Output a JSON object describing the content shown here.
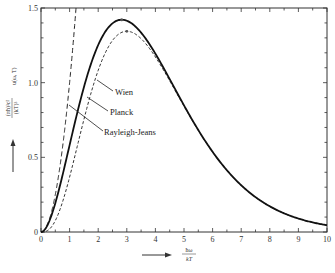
{
  "chart_data": {
    "type": "line",
    "title": "",
    "xlabel": "ħω / kT",
    "ylabel": "(πħ)³c² / (kT)³ · u(ω, T)",
    "xlim": [
      0,
      10
    ],
    "ylim": [
      0,
      1.5
    ],
    "x_ticks": [
      "0",
      "1",
      "2",
      "3",
      "4",
      "5",
      "6",
      "7",
      "8",
      "9",
      "10"
    ],
    "y_ticks": [
      "0",
      "0.5",
      "1.0",
      "1.5"
    ],
    "grid": false,
    "legend_position": "inline annotations with leader lines",
    "series": [
      {
        "name": "Planck",
        "style": "solid-thick",
        "formula": "x^3/(e^x - 1)",
        "x": [
          0,
          0.5,
          1,
          1.5,
          2,
          2.5,
          2.82,
          3,
          3.5,
          4,
          5,
          6,
          7,
          8,
          9,
          10
        ],
        "values": [
          0,
          0.193,
          0.582,
          0.971,
          1.252,
          1.4,
          1.421,
          1.419,
          1.334,
          1.195,
          0.852,
          0.539,
          0.313,
          0.172,
          0.09,
          0.045
        ],
        "peak": {
          "x": 2.82,
          "y": 1.42
        }
      },
      {
        "name": "Wien",
        "style": "dashed",
        "formula": "x^3 e^-x",
        "x": [
          0,
          0.5,
          1,
          1.5,
          2,
          2.5,
          3,
          3.5,
          4,
          5,
          6,
          7,
          8,
          9,
          10
        ],
        "values": [
          0,
          0.076,
          0.368,
          0.753,
          1.083,
          1.282,
          1.344,
          1.293,
          1.172,
          0.842,
          0.535,
          0.313,
          0.172,
          0.09,
          0.045
        ],
        "peak": {
          "x": 3.0,
          "y": 1.34
        }
      },
      {
        "name": "Rayleigh-Jeans",
        "style": "long-dashed",
        "formula": "x^2",
        "x": [
          0,
          0.5,
          1,
          1.22
        ],
        "values": [
          0,
          0.25,
          1.0,
          1.5
        ]
      }
    ],
    "annotations": [
      "Wien",
      "Planck",
      "Rayleigh-Jeans"
    ]
  },
  "labels": {
    "wien": "Wien",
    "planck": "Planck",
    "rayleigh_jeans": "Rayleigh-Jeans",
    "y_axis_numerator": "(πħ)³c²",
    "y_axis_denominator": "(kT)³",
    "y_axis_suffix": "u(ω, T)",
    "x_axis_numerator": "ħω",
    "x_axis_denominator": "kT"
  }
}
